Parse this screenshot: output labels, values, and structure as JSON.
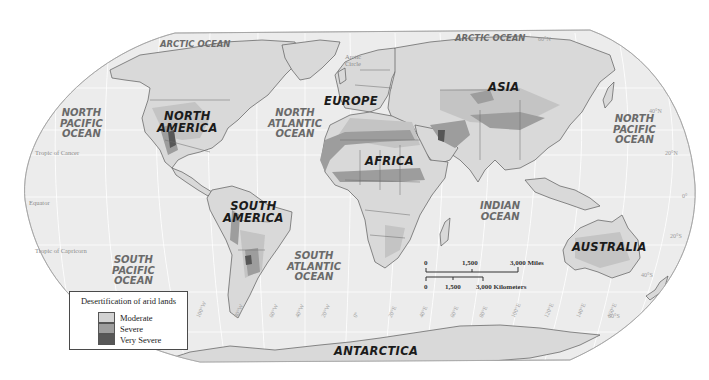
{
  "map": {
    "title": "Desertification of arid lands",
    "colors": {
      "background": "#ffffff",
      "ocean": "#ececec",
      "land": "#d6d6d6",
      "border": "#555555",
      "graticule": "#ffffff",
      "moderate": "#d2d2d2",
      "severe": "#9d9d9d",
      "very_severe": "#575757"
    },
    "legend": {
      "title": "Desertification of arid lands",
      "items": [
        {
          "label": "Moderate",
          "color": "#d2d2d2"
        },
        {
          "label": "Severe",
          "color": "#9d9d9d"
        },
        {
          "label": "Very Severe",
          "color": "#575757"
        }
      ]
    },
    "continents": {
      "north_america": "NORTH\nAMERICA",
      "south_america": "SOUTH\nAMERICA",
      "europe": "EUROPE",
      "africa": "AFRICA",
      "asia": "ASIA",
      "australia": "AUSTRALIA",
      "antarctica": "ANTARCTICA"
    },
    "oceans": {
      "arctic_left": "ARCTIC OCEAN",
      "arctic_right": "ARCTIC OCEAN",
      "north_pacific_left": "NORTH\nPACIFIC\nOCEAN",
      "north_pacific_right": "NORTH\nPACIFIC\nOCEAN",
      "north_atlantic": "NORTH\nATLANTIC\nOCEAN",
      "south_pacific": "SOUTH\nPACIFIC\nOCEAN",
      "south_atlantic": "SOUTH\nATLANTIC\nOCEAN",
      "indian": "INDIAN\nOCEAN"
    },
    "reference_lines": {
      "arctic_circle": "Arctic\nCircle",
      "tropic_of_cancer": "Tropic of Cancer",
      "equator": "Equator",
      "tropic_of_capricorn": "Tropic of Capricorn"
    },
    "latitudes": [
      "60°N",
      "40°N",
      "20°N",
      "0°",
      "20°S",
      "40°S",
      "60°S"
    ],
    "longitudes": [
      "100°W",
      "80°W",
      "60°W",
      "40°W",
      "20°W",
      "0°",
      "20°E",
      "40°E",
      "60°E",
      "80°E",
      "100°E",
      "120°E",
      "140°E",
      "160°E"
    ],
    "scale": {
      "miles": {
        "ticks": [
          "0",
          "1,500",
          "3,000 Miles"
        ]
      },
      "kilometers": {
        "ticks": [
          "0",
          "1,500",
          "3,000 Kilometers"
        ]
      }
    }
  }
}
